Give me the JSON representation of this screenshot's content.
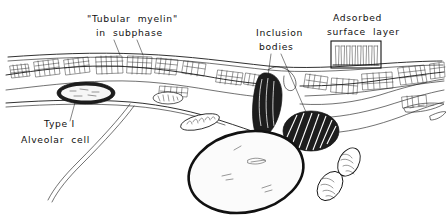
{
  "figure": {
    "style": "pen-and-ink line drawing",
    "background_color": "#ffffff",
    "ink_color": "#1a1a1a",
    "width": 446,
    "height": 220
  },
  "labels": {
    "tubular_myelin_line1": "\"Tubular  myelin\"",
    "tubular_myelin_line2": "in  subphase",
    "inclusion_line1": "Inclusion",
    "inclusion_line2": "bodies",
    "adsorbed_line1": "Adsorbed",
    "adsorbed_line2": "surface  layer",
    "typei_line1": "Type I",
    "typei_line2": "Alveolar  cell"
  },
  "structures": {
    "adsorbed_surface_layer": {
      "name": "adsorbed surface layer detail box",
      "molecule_count": 8,
      "description": "boxed inset showing upright surfactant molecules at air-liquid interface"
    },
    "tubular_myelin": {
      "name": "tubular myelin lattices",
      "description": "cross-hatched lattice bodies in the subphase beneath the air-liquid interface"
    },
    "inclusion_bodies": {
      "name": "inclusion bodies",
      "count": 2,
      "description": "dark striated lamellar bodies, one teardrop at the apical surface and one hatched oval in cytoplasm"
    },
    "nucleus": {
      "name": "nucleus",
      "description": "large stippled oval in lower centre of cell"
    },
    "mitochondria": {
      "name": "mitochondria",
      "count": 3,
      "description": "small outlined organelles with internal cristae"
    },
    "type_i_organelle": {
      "name": "dark organelle in type I alveolar cell",
      "description": "stippled dark-rimmed oval at left indicated by the Type I leader"
    }
  }
}
